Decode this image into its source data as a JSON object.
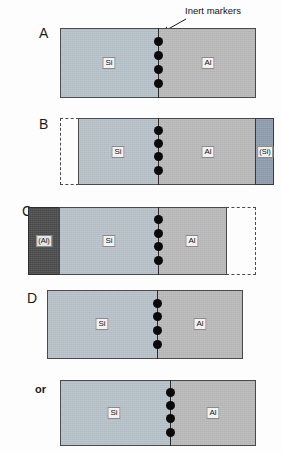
{
  "figure": {
    "callout": {
      "label": "Inert markers"
    },
    "colors": {
      "si": "#b7c1c9",
      "al": "#b9b9b9",
      "si_void": "#8d9cad",
      "al_void": "#4a4a4a",
      "marker": "#0a0a0a",
      "outline": "#4a4a4a",
      "interface": "#2b2b2b",
      "background": "#fdfdfd"
    },
    "panels": [
      {
        "id": "A",
        "letter": "A",
        "regions": [
          {
            "name": "si",
            "label": "Si",
            "kind": "solid"
          },
          {
            "name": "al",
            "label": "Al",
            "kind": "solid"
          }
        ],
        "marker_count": 4,
        "ghost": null
      },
      {
        "id": "B",
        "letter": "B",
        "regions": [
          {
            "name": "si",
            "label": "Si",
            "kind": "solid"
          },
          {
            "name": "al",
            "label": "Al",
            "kind": "solid"
          },
          {
            "name": "si_void",
            "label": "(Si)",
            "kind": "solid"
          }
        ],
        "marker_count": 4,
        "ghost": {
          "side": "left"
        }
      },
      {
        "id": "C",
        "letter": "C",
        "regions": [
          {
            "name": "al_void",
            "label": "(Al)",
            "kind": "solid"
          },
          {
            "name": "si",
            "label": "Si",
            "kind": "solid"
          },
          {
            "name": "al",
            "label": "Al",
            "kind": "solid"
          }
        ],
        "marker_count": 4,
        "ghost": {
          "side": "right"
        }
      },
      {
        "id": "D",
        "letter": "D",
        "regions": [
          {
            "name": "si",
            "label": "Si",
            "kind": "solid"
          },
          {
            "name": "al",
            "label": "Al",
            "kind": "solid"
          }
        ],
        "marker_count": 4,
        "ghost": null
      },
      {
        "id": "D-alt",
        "letter": "or",
        "regions": [
          {
            "name": "si",
            "label": "Si",
            "kind": "solid"
          },
          {
            "name": "al",
            "label": "Al",
            "kind": "solid"
          }
        ],
        "marker_count": 4,
        "ghost": null
      }
    ],
    "labels": {
      "si": "Si",
      "al": "Al",
      "si_void": "(Si)",
      "al_void": "(Al)",
      "or": "or",
      "letter_a": "A",
      "letter_b": "B",
      "letter_c": "C",
      "letter_d": "D"
    }
  }
}
